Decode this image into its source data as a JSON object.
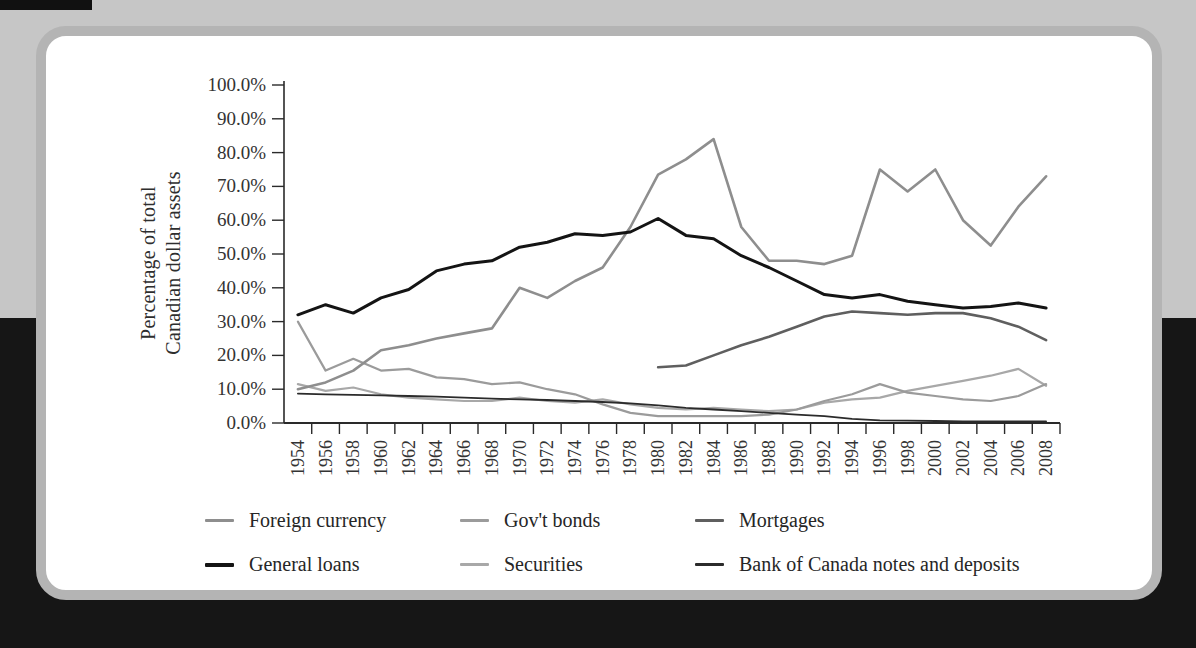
{
  "figure": {
    "y_axis_title_line1": "Percentage of total",
    "y_axis_title_line2": "Canadian dollar assets"
  },
  "chart_data": {
    "type": "line",
    "title": "",
    "xlabel": "",
    "ylabel": "Percentage of total Canadian dollar assets",
    "ylim": [
      0,
      100
    ],
    "grid": false,
    "legend_position": "bottom",
    "y_tick_labels": [
      "100.0%",
      "90.0%",
      "80.0%",
      "70.0%",
      "60.0%",
      "50.0%",
      "40.0%",
      "30.0%",
      "20.0%",
      "10.0%",
      "0.0%"
    ],
    "categories": [
      "1954",
      "1956",
      "1958",
      "1960",
      "1962",
      "1964",
      "1966",
      "1968",
      "1970",
      "1972",
      "1974",
      "1976",
      "1978",
      "1980",
      "1982",
      "1984",
      "1986",
      "1988",
      "1990",
      "1992",
      "1994",
      "1996",
      "1998",
      "2000",
      "2002",
      "2004",
      "2006",
      "2008"
    ],
    "series": [
      {
        "name": "Securities",
        "color": "#a8a8a8",
        "width": 2.2,
        "values": [
          11.5,
          9.5,
          10.5,
          8.5,
          7.5,
          7,
          6.5,
          6.5,
          7.5,
          6.5,
          6,
          7,
          5.5,
          4.5,
          4,
          4.5,
          4,
          3.5,
          4,
          6,
          7,
          7.5,
          9.5,
          11,
          12.5,
          14,
          16,
          11
        ]
      },
      {
        "name": "Gov't bonds",
        "color": "#9b9b9b",
        "width": 2.2,
        "values": [
          30,
          15.5,
          19,
          15.5,
          16,
          13.5,
          13,
          11.5,
          12,
          10,
          8.5,
          5.5,
          3,
          2,
          2,
          2,
          2,
          2.5,
          4,
          6.5,
          8.5,
          11.5,
          9,
          8,
          7,
          6.5,
          8,
          11.5
        ]
      },
      {
        "name": "Bank of Canada notes and deposits",
        "color": "#2b2b2b",
        "width": 1.8,
        "values": [
          8.7,
          8.5,
          8.3,
          8.2,
          8,
          7.8,
          7.5,
          7.2,
          7,
          6.8,
          6.5,
          6.2,
          5.8,
          5.2,
          4.5,
          4,
          3.5,
          3,
          2.5,
          2,
          1.2,
          0.8,
          0.7,
          0.6,
          0.5,
          0.5,
          0.5,
          0.5
        ]
      },
      {
        "name": "Mortgages",
        "color": "#5f5f5f",
        "width": 2.6,
        "values": [
          null,
          null,
          null,
          null,
          null,
          null,
          null,
          null,
          null,
          null,
          null,
          null,
          null,
          16.5,
          17,
          20,
          23,
          25.5,
          28.5,
          31.5,
          33,
          32.5,
          32,
          32.5,
          32.5,
          31,
          28.5,
          24.5
        ]
      },
      {
        "name": "Foreign currency",
        "color": "#8e8e8e",
        "width": 2.6,
        "values": [
          10,
          12,
          15.5,
          21.5,
          23,
          25,
          26.5,
          28,
          40,
          37,
          42,
          46,
          58,
          73.5,
          78,
          84,
          58,
          48,
          48,
          47,
          49.5,
          75,
          68.5,
          75,
          60,
          52.5,
          64,
          73
        ]
      },
      {
        "name": "General loans",
        "color": "#141414",
        "width": 3,
        "values": [
          32,
          35,
          32.5,
          37,
          39.5,
          45,
          47,
          48,
          52,
          53.5,
          56,
          55.5,
          56.5,
          60.5,
          55.5,
          54.5,
          49.5,
          46,
          42,
          38,
          37,
          38,
          36,
          35,
          34,
          34.5,
          35.5,
          34
        ]
      }
    ]
  },
  "legend": {
    "rows": [
      [
        {
          "label": "Foreign currency",
          "color": "#8e8e8e",
          "thick": 3
        },
        {
          "label": "Gov't bonds",
          "color": "#9b9b9b",
          "thick": 3
        },
        {
          "label": "Mortgages",
          "color": "#5f5f5f",
          "thick": 3
        }
      ],
      [
        {
          "label": "General loans",
          "color": "#141414",
          "thick": 4
        },
        {
          "label": "Securities",
          "color": "#a8a8a8",
          "thick": 3
        },
        {
          "label": "Bank of Canada notes and deposits",
          "color": "#2b2b2b",
          "thick": 3
        }
      ]
    ]
  },
  "palette": {
    "backdrop_top": "#c6c6c6",
    "backdrop_bottom": "#161616",
    "card_border": "#b4b4b4",
    "card_bg": "#ffffff",
    "axis": "#2a2a2a",
    "tick_text": "#333333"
  }
}
